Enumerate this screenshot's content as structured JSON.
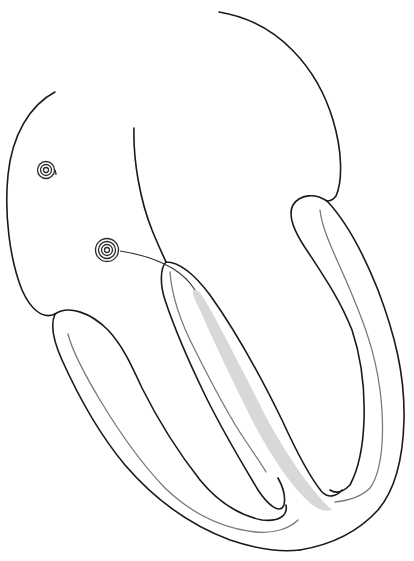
{
  "diagram": {
    "title": "",
    "labels": [],
    "elements": [
      {
        "id": "left-atrium-outline",
        "kind": "outline"
      },
      {
        "id": "right-atrium-outline",
        "kind": "outline"
      },
      {
        "id": "atrial-septum",
        "kind": "outline"
      },
      {
        "id": "sa-node",
        "kind": "spiral-icon"
      },
      {
        "id": "av-node",
        "kind": "spiral-icon"
      },
      {
        "id": "conduction-lead",
        "kind": "line"
      },
      {
        "id": "left-ventricle-wall",
        "kind": "outline"
      },
      {
        "id": "interventricular-septum",
        "kind": "outline"
      },
      {
        "id": "right-ventricle-wall",
        "kind": "outline"
      },
      {
        "id": "bundle-of-his-shading",
        "kind": "shaded-region"
      }
    ],
    "colors": {
      "outline": "#1a1a1a",
      "inner_line": "#7a7a7a",
      "bundle_fill": "#d4d4d4",
      "background": "#ffffff"
    }
  }
}
